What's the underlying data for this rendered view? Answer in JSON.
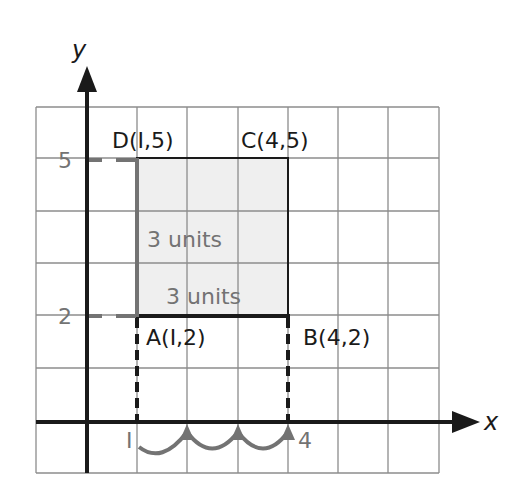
{
  "axes": {
    "x_label": "x",
    "y_label": "y",
    "y_ticks": [
      {
        "value": 5,
        "label": "5"
      },
      {
        "value": 2,
        "label": "2"
      }
    ],
    "x_ticks": [
      {
        "value": 1,
        "label": "I"
      },
      {
        "value": 4,
        "label": "4"
      }
    ]
  },
  "points": {
    "A": {
      "label": "A(I,2)",
      "x": 1,
      "y": 2
    },
    "B": {
      "label": "B(4,2)",
      "x": 4,
      "y": 2
    },
    "C": {
      "label": "C(4,5)",
      "x": 4,
      "y": 5
    },
    "D": {
      "label": "D(I,5)",
      "x": 1,
      "y": 5
    }
  },
  "annotations": {
    "vertical_side": "3 units",
    "horizontal_side": "3 units"
  },
  "colors": {
    "axis": "#1a1a1a",
    "grid": "#8c8c8c",
    "fill": "#efefef",
    "accent_gray": "#737373",
    "text": "#1a1a1a"
  }
}
